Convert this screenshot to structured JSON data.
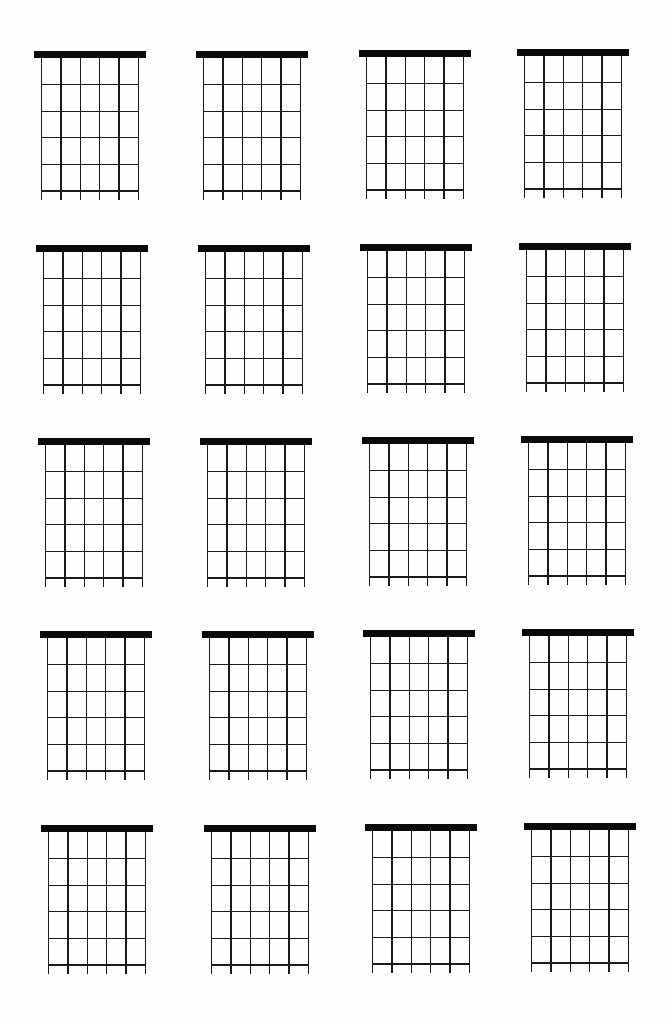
{
  "page": {
    "background": "#ffffff",
    "ink_color": "#0a0a0a"
  },
  "grid": {
    "rows": 5,
    "columns": 4,
    "strings_per_diagram": 6,
    "frets_per_diagram": 5,
    "nut_width": 112,
    "nut_height": 7,
    "string_inset": 7.5,
    "fret_spacing": 26.6,
    "string_tail": 9
  },
  "diagrams": [
    {
      "row": 1,
      "col": 1,
      "x": 34,
      "y": 51
    },
    {
      "row": 1,
      "col": 2,
      "x": 196,
      "y": 51
    },
    {
      "row": 1,
      "col": 3,
      "x": 359,
      "y": 50
    },
    {
      "row": 1,
      "col": 4,
      "x": 517,
      "y": 49
    },
    {
      "row": 2,
      "col": 1,
      "x": 36,
      "y": 245
    },
    {
      "row": 2,
      "col": 2,
      "x": 198,
      "y": 245
    },
    {
      "row": 2,
      "col": 3,
      "x": 360,
      "y": 244
    },
    {
      "row": 2,
      "col": 4,
      "x": 519,
      "y": 243
    },
    {
      "row": 3,
      "col": 1,
      "x": 38,
      "y": 438
    },
    {
      "row": 3,
      "col": 2,
      "x": 200,
      "y": 438
    },
    {
      "row": 3,
      "col": 3,
      "x": 362,
      "y": 437
    },
    {
      "row": 3,
      "col": 4,
      "x": 521,
      "y": 436
    },
    {
      "row": 4,
      "col": 1,
      "x": 40,
      "y": 631
    },
    {
      "row": 4,
      "col": 2,
      "x": 202,
      "y": 631
    },
    {
      "row": 4,
      "col": 3,
      "x": 363,
      "y": 630
    },
    {
      "row": 4,
      "col": 4,
      "x": 522,
      "y": 629
    },
    {
      "row": 5,
      "col": 1,
      "x": 41,
      "y": 825
    },
    {
      "row": 5,
      "col": 2,
      "x": 204,
      "y": 825
    },
    {
      "row": 5,
      "col": 3,
      "x": 365,
      "y": 824
    },
    {
      "row": 5,
      "col": 4,
      "x": 524,
      "y": 823
    }
  ]
}
